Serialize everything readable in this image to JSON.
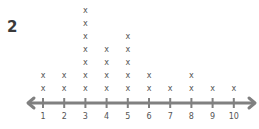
{
  "problem_number": "2",
  "chart_data": {
    "type": "line-plot",
    "title": "",
    "xlabel": "",
    "ylabel": "",
    "marker": "x",
    "categories": [
      "1",
      "2",
      "3",
      "4",
      "5",
      "6",
      "7",
      "8",
      "9",
      "10"
    ],
    "values": [
      2,
      2,
      7,
      4,
      5,
      2,
      1,
      2,
      1,
      1
    ],
    "xlim": [
      1,
      10
    ],
    "axis": {
      "arrows": "both",
      "grid": false
    },
    "colors": {
      "axis": "#808080",
      "marks": "#555555"
    }
  }
}
